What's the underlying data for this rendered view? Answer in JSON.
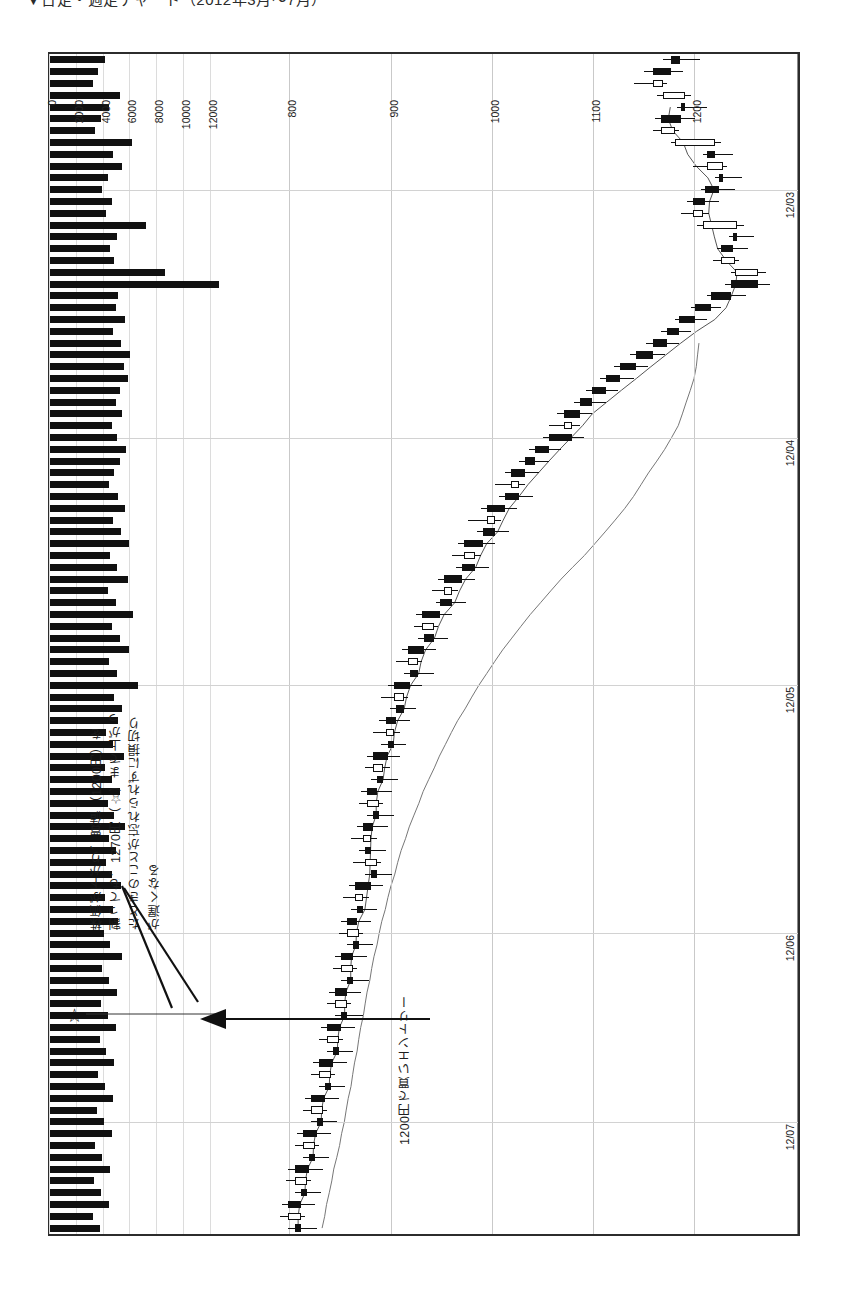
{
  "page": {
    "heading": "▼日足・週足チャート（2012年3月〜7月）"
  },
  "annotations": {
    "loss_cut": "株価が下がり、買値（1200円）を\n割っても、1270円（☆）まで上がっ\nたときのことが忘れられずに損切り\nが遅くなる",
    "entry": "1200円で買いエントリー",
    "star_glyph": "☆"
  },
  "chart_data": {
    "type": "candlestick",
    "orientation": "rotated-90",
    "xlabel": "",
    "ylabel": "株価（円）",
    "price_axis": {
      "ticks": [
        1200,
        1100,
        1000,
        900,
        800
      ],
      "min": 760,
      "max": 1290,
      "unit": "円"
    },
    "volume_axis": {
      "ticks": [
        0,
        2000,
        4000,
        6000,
        8000,
        10000,
        12000
      ],
      "min": 0,
      "max": 13000,
      "unit": "株"
    },
    "date_ticks": [
      "12/03",
      "12/04",
      "12/05",
      "12/06",
      "12/07"
    ],
    "date_tick_positions": [
      0.115,
      0.325,
      0.535,
      0.745,
      0.905
    ],
    "legend": [],
    "grid": true,
    "markers": [
      {
        "label": "☆",
        "price": 1270,
        "note": "高値"
      },
      {
        "label": "買いエントリー",
        "price": 1200
      }
    ],
    "series": [
      {
        "name": "移動平均（短期）",
        "type": "line"
      },
      {
        "name": "移動平均（長期）",
        "type": "line"
      }
    ],
    "candles": [
      {
        "o": 1185,
        "h": 1205,
        "l": 1168,
        "c": 1176,
        "v": 4100
      },
      {
        "o": 1176,
        "h": 1188,
        "l": 1150,
        "c": 1158,
        "v": 3600
      },
      {
        "o": 1158,
        "h": 1172,
        "l": 1140,
        "c": 1168,
        "v": 3200
      },
      {
        "o": 1168,
        "h": 1196,
        "l": 1162,
        "c": 1190,
        "v": 5200
      },
      {
        "o": 1190,
        "h": 1212,
        "l": 1182,
        "c": 1186,
        "v": 4400
      },
      {
        "o": 1186,
        "h": 1200,
        "l": 1160,
        "c": 1166,
        "v": 3800
      },
      {
        "o": 1166,
        "h": 1184,
        "l": 1158,
        "c": 1180,
        "v": 3400
      },
      {
        "o": 1180,
        "h": 1226,
        "l": 1176,
        "c": 1220,
        "v": 6100
      },
      {
        "o": 1220,
        "h": 1238,
        "l": 1208,
        "c": 1212,
        "v": 4700
      },
      {
        "o": 1212,
        "h": 1232,
        "l": 1198,
        "c": 1228,
        "v": 5400
      },
      {
        "o": 1228,
        "h": 1246,
        "l": 1220,
        "c": 1224,
        "v": 4300
      },
      {
        "o": 1224,
        "h": 1240,
        "l": 1206,
        "c": 1210,
        "v": 3900
      },
      {
        "o": 1210,
        "h": 1224,
        "l": 1192,
        "c": 1198,
        "v": 4600
      },
      {
        "o": 1198,
        "h": 1214,
        "l": 1186,
        "c": 1208,
        "v": 4200
      },
      {
        "o": 1208,
        "h": 1248,
        "l": 1202,
        "c": 1242,
        "v": 7200
      },
      {
        "o": 1242,
        "h": 1258,
        "l": 1234,
        "c": 1238,
        "v": 5000
      },
      {
        "o": 1238,
        "h": 1252,
        "l": 1222,
        "c": 1226,
        "v": 4500
      },
      {
        "o": 1226,
        "h": 1244,
        "l": 1218,
        "c": 1240,
        "v": 4800
      },
      {
        "o": 1240,
        "h": 1270,
        "l": 1236,
        "c": 1262,
        "v": 8600
      },
      {
        "o": 1262,
        "h": 1274,
        "l": 1230,
        "c": 1236,
        "v": 6400
      },
      {
        "o": 1236,
        "h": 1250,
        "l": 1212,
        "c": 1216,
        "v": 5100
      },
      {
        "o": 1216,
        "h": 1226,
        "l": 1196,
        "c": 1200,
        "v": 4900
      },
      {
        "o": 1200,
        "h": 1212,
        "l": 1180,
        "c": 1184,
        "v": 5600
      },
      {
        "o": 1184,
        "h": 1196,
        "l": 1166,
        "c": 1172,
        "v": 4700
      },
      {
        "o": 1172,
        "h": 1184,
        "l": 1152,
        "c": 1158,
        "v": 5300
      },
      {
        "o": 1158,
        "h": 1170,
        "l": 1136,
        "c": 1142,
        "v": 6000
      },
      {
        "o": 1142,
        "h": 1154,
        "l": 1120,
        "c": 1126,
        "v": 5500
      },
      {
        "o": 1126,
        "h": 1140,
        "l": 1106,
        "c": 1112,
        "v": 5800
      },
      {
        "o": 1112,
        "h": 1124,
        "l": 1092,
        "c": 1098,
        "v": 5200
      },
      {
        "o": 1098,
        "h": 1112,
        "l": 1080,
        "c": 1086,
        "v": 4900
      },
      {
        "o": 1086,
        "h": 1098,
        "l": 1064,
        "c": 1070,
        "v": 5400
      },
      {
        "o": 1070,
        "h": 1086,
        "l": 1056,
        "c": 1078,
        "v": 4600
      },
      {
        "o": 1078,
        "h": 1090,
        "l": 1050,
        "c": 1056,
        "v": 5000
      },
      {
        "o": 1056,
        "h": 1068,
        "l": 1036,
        "c": 1042,
        "v": 5700
      },
      {
        "o": 1042,
        "h": 1056,
        "l": 1026,
        "c": 1032,
        "v": 5200
      },
      {
        "o": 1032,
        "h": 1046,
        "l": 1012,
        "c": 1018,
        "v": 4800
      },
      {
        "o": 1018,
        "h": 1032,
        "l": 1002,
        "c": 1026,
        "v": 4400
      },
      {
        "o": 1026,
        "h": 1040,
        "l": 1006,
        "c": 1012,
        "v": 5100
      },
      {
        "o": 1012,
        "h": 1024,
        "l": 988,
        "c": 994,
        "v": 5600
      },
      {
        "o": 994,
        "h": 1008,
        "l": 976,
        "c": 1002,
        "v": 4700
      },
      {
        "o": 1002,
        "h": 1016,
        "l": 984,
        "c": 990,
        "v": 5300
      },
      {
        "o": 990,
        "h": 1002,
        "l": 966,
        "c": 972,
        "v": 5900
      },
      {
        "o": 972,
        "h": 988,
        "l": 960,
        "c": 982,
        "v": 4500
      },
      {
        "o": 982,
        "h": 996,
        "l": 964,
        "c": 970,
        "v": 5000
      },
      {
        "o": 970,
        "h": 982,
        "l": 946,
        "c": 952,
        "v": 5800
      },
      {
        "o": 952,
        "h": 966,
        "l": 940,
        "c": 960,
        "v": 4300
      },
      {
        "o": 960,
        "h": 974,
        "l": 944,
        "c": 948,
        "v": 4900
      },
      {
        "o": 948,
        "h": 960,
        "l": 924,
        "c": 930,
        "v": 6200
      },
      {
        "o": 930,
        "h": 946,
        "l": 922,
        "c": 942,
        "v": 4600
      },
      {
        "o": 942,
        "h": 956,
        "l": 926,
        "c": 932,
        "v": 5200
      },
      {
        "o": 932,
        "h": 944,
        "l": 910,
        "c": 916,
        "v": 5900
      },
      {
        "o": 916,
        "h": 930,
        "l": 904,
        "c": 926,
        "v": 4400
      },
      {
        "o": 926,
        "h": 942,
        "l": 912,
        "c": 918,
        "v": 5000
      },
      {
        "o": 918,
        "h": 930,
        "l": 896,
        "c": 902,
        "v": 6600
      },
      {
        "o": 902,
        "h": 916,
        "l": 890,
        "c": 912,
        "v": 4800
      },
      {
        "o": 912,
        "h": 924,
        "l": 898,
        "c": 904,
        "v": 5400
      },
      {
        "o": 904,
        "h": 918,
        "l": 888,
        "c": 894,
        "v": 5100
      },
      {
        "o": 894,
        "h": 908,
        "l": 882,
        "c": 902,
        "v": 4200
      },
      {
        "o": 902,
        "h": 914,
        "l": 890,
        "c": 896,
        "v": 4700
      },
      {
        "o": 896,
        "h": 908,
        "l": 876,
        "c": 882,
        "v": 5500
      },
      {
        "o": 882,
        "h": 898,
        "l": 874,
        "c": 892,
        "v": 4100
      },
      {
        "o": 892,
        "h": 906,
        "l": 880,
        "c": 886,
        "v": 4600
      },
      {
        "o": 886,
        "h": 900,
        "l": 870,
        "c": 876,
        "v": 5200
      },
      {
        "o": 876,
        "h": 892,
        "l": 868,
        "c": 888,
        "v": 4300
      },
      {
        "o": 888,
        "h": 902,
        "l": 876,
        "c": 882,
        "v": 4800
      },
      {
        "o": 882,
        "h": 896,
        "l": 866,
        "c": 872,
        "v": 5600
      },
      {
        "o": 872,
        "h": 886,
        "l": 860,
        "c": 880,
        "v": 4400
      },
      {
        "o": 880,
        "h": 894,
        "l": 868,
        "c": 874,
        "v": 4900
      },
      {
        "o": 874,
        "h": 890,
        "l": 862,
        "c": 886,
        "v": 4200
      },
      {
        "o": 886,
        "h": 900,
        "l": 874,
        "c": 880,
        "v": 4600
      },
      {
        "o": 880,
        "h": 892,
        "l": 858,
        "c": 864,
        "v": 5300
      },
      {
        "o": 864,
        "h": 878,
        "l": 852,
        "c": 872,
        "v": 4100
      },
      {
        "o": 872,
        "h": 886,
        "l": 860,
        "c": 866,
        "v": 4700
      },
      {
        "o": 866,
        "h": 880,
        "l": 850,
        "c": 856,
        "v": 5100
      },
      {
        "o": 856,
        "h": 872,
        "l": 848,
        "c": 868,
        "v": 4000
      },
      {
        "o": 868,
        "h": 882,
        "l": 856,
        "c": 862,
        "v": 4500
      },
      {
        "o": 862,
        "h": 876,
        "l": 844,
        "c": 850,
        "v": 5400
      },
      {
        "o": 850,
        "h": 866,
        "l": 842,
        "c": 862,
        "v": 3900
      },
      {
        "o": 862,
        "h": 878,
        "l": 850,
        "c": 856,
        "v": 4400
      },
      {
        "o": 856,
        "h": 870,
        "l": 838,
        "c": 844,
        "v": 5000
      },
      {
        "o": 844,
        "h": 860,
        "l": 836,
        "c": 856,
        "v": 3800
      },
      {
        "o": 856,
        "h": 872,
        "l": 844,
        "c": 850,
        "v": 4300
      },
      {
        "o": 850,
        "h": 864,
        "l": 830,
        "c": 836,
        "v": 4900
      },
      {
        "o": 836,
        "h": 852,
        "l": 828,
        "c": 848,
        "v": 3700
      },
      {
        "o": 848,
        "h": 862,
        "l": 836,
        "c": 842,
        "v": 4200
      },
      {
        "o": 842,
        "h": 856,
        "l": 822,
        "c": 828,
        "v": 4800
      },
      {
        "o": 828,
        "h": 844,
        "l": 820,
        "c": 840,
        "v": 3600
      },
      {
        "o": 840,
        "h": 854,
        "l": 828,
        "c": 834,
        "v": 4100
      },
      {
        "o": 834,
        "h": 848,
        "l": 814,
        "c": 820,
        "v": 4700
      },
      {
        "o": 820,
        "h": 836,
        "l": 812,
        "c": 832,
        "v": 3500
      },
      {
        "o": 832,
        "h": 846,
        "l": 820,
        "c": 826,
        "v": 4000
      },
      {
        "o": 826,
        "h": 840,
        "l": 806,
        "c": 812,
        "v": 4600
      },
      {
        "o": 812,
        "h": 828,
        "l": 804,
        "c": 824,
        "v": 3400
      },
      {
        "o": 824,
        "h": 838,
        "l": 812,
        "c": 818,
        "v": 3900
      },
      {
        "o": 818,
        "h": 832,
        "l": 798,
        "c": 804,
        "v": 4500
      },
      {
        "o": 804,
        "h": 820,
        "l": 796,
        "c": 816,
        "v": 3300
      },
      {
        "o": 816,
        "h": 830,
        "l": 804,
        "c": 810,
        "v": 3800
      },
      {
        "o": 810,
        "h": 824,
        "l": 792,
        "c": 798,
        "v": 4400
      },
      {
        "o": 798,
        "h": 814,
        "l": 790,
        "c": 810,
        "v": 3200
      },
      {
        "o": 810,
        "h": 826,
        "l": 798,
        "c": 804,
        "v": 3700
      }
    ]
  }
}
